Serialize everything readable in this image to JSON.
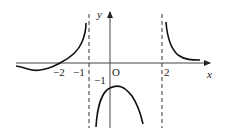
{
  "figure": {
    "type": "function-graph",
    "axes": {
      "x_label": "x",
      "y_label": "y",
      "origin_label": "O"
    },
    "ticks": {
      "x": [
        {
          "value": -2,
          "label": "−2"
        },
        {
          "value": -1,
          "label": "−1"
        },
        {
          "value": 2,
          "label": "2"
        }
      ],
      "y": [
        {
          "value": -1,
          "label": "−1"
        }
      ]
    },
    "asymptotes": [
      {
        "type": "vertical",
        "between": "x=-1 and x=0",
        "style": "dashed"
      },
      {
        "type": "vertical",
        "at": "x=2",
        "style": "dashed"
      }
    ],
    "branches": [
      {
        "name": "left-branch",
        "description": "dips below x-axis for x<-2, crosses at x=-2, rises to +infinity near left asymptote"
      },
      {
        "name": "middle-branch",
        "description": "downward arch with maximum at (0,-1), tends to -infinity at both asymptotes"
      },
      {
        "name": "right-branch",
        "description": "decreases from +infinity at x=2 toward the x-axis"
      }
    ]
  }
}
